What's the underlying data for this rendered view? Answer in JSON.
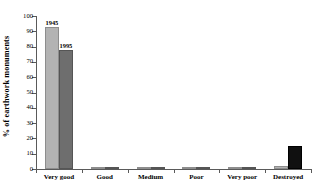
{
  "chart_data": {
    "type": "bar",
    "title": "",
    "xlabel": "",
    "ylabel": "% of earthwork monuments",
    "ylim": [
      0,
      100
    ],
    "yticks": [
      0,
      10,
      20,
      30,
      40,
      50,
      60,
      70,
      80,
      90,
      100
    ],
    "grid": false,
    "legend": "none",
    "categories": [
      "Very good",
      "Good",
      "Medium",
      "Poor",
      "Very poor",
      "Destroyed"
    ],
    "series": [
      {
        "name": "1945",
        "color": "#b3b3b3",
        "values": [
          93,
          0.5,
          1,
          1.5,
          0.5,
          2
        ]
      },
      {
        "name": "1995",
        "color": "#6e6e6e",
        "values": [
          78,
          1.5,
          1.5,
          1.5,
          1,
          15
        ]
      }
    ],
    "annotations": [
      {
        "text": "1945",
        "series": "1945",
        "category": "Very good"
      },
      {
        "text": "1995",
        "series": "1995",
        "category": "Very good"
      }
    ],
    "series_color_overrides": [
      {
        "series": "1995",
        "category": "Destroyed",
        "color": "#101010"
      }
    ]
  }
}
